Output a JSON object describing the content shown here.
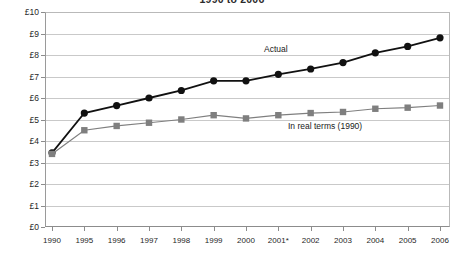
{
  "chart_data": {
    "type": "line",
    "title": "1990 to 2006",
    "subtitle": "",
    "xlabel": "",
    "ylabel": "",
    "ylim": [
      0,
      10
    ],
    "y_tick_labels": [
      "£0",
      "£1",
      "£2",
      "£3",
      "£4",
      "£5",
      "£6",
      "£7",
      "£8",
      "£9",
      "£10"
    ],
    "y_tick_values": [
      0,
      1,
      2,
      3,
      4,
      5,
      6,
      7,
      8,
      9,
      10
    ],
    "currency_symbol": "£",
    "grid": true,
    "legend_position": "inline-annotation",
    "categories": [
      "1990",
      "1995",
      "1996",
      "1997",
      "1998",
      "1999",
      "2000",
      "2001*",
      "2002",
      "2003",
      "2004",
      "2005",
      "2006"
    ],
    "series": [
      {
        "name": "Actual",
        "marker": "circle",
        "color": "#111111",
        "line_color": "#111111",
        "values": [
          3.45,
          5.3,
          5.65,
          6.0,
          6.35,
          6.8,
          6.8,
          7.1,
          7.35,
          7.65,
          8.1,
          8.4,
          8.8
        ]
      },
      {
        "name": "In real terms (1990)",
        "marker": "square",
        "color": "#7f7f7f",
        "line_color": "#7f7f7f",
        "values": [
          3.4,
          4.5,
          4.7,
          4.85,
          5.0,
          5.2,
          5.05,
          5.2,
          5.3,
          5.35,
          5.5,
          5.55,
          5.65
        ]
      }
    ],
    "annotations": [
      {
        "text": "Actual",
        "series": "Actual"
      },
      {
        "text": "In real terms (1990)",
        "series": "In real terms (1990)"
      }
    ],
    "footnote_marker": "*"
  },
  "colors": {
    "actual": "#111111",
    "real_terms": "#7f7f7f",
    "gridline": "#c9c9c9",
    "axis": "#8c8c8c",
    "background": "#ffffff"
  }
}
